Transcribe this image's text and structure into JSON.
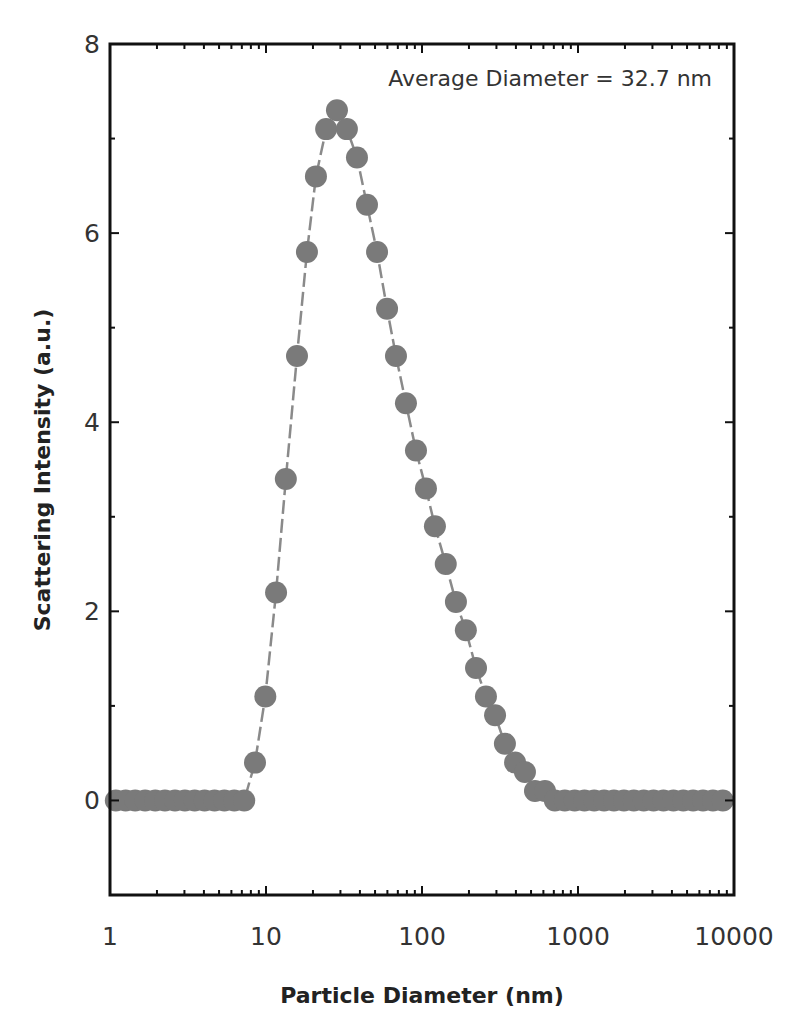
{
  "chart_data": {
    "type": "scatter",
    "title": "",
    "xlabel": "Particle Diameter (nm)",
    "ylabel": "Scattering Intensity (a.u.)",
    "xscale": "log",
    "xlim": [
      1,
      10000
    ],
    "ylim": [
      -1,
      8
    ],
    "xticks": [
      1,
      10,
      100,
      1000,
      10000
    ],
    "xtick_labels": [
      "1",
      "10",
      "100",
      "1000",
      "10000"
    ],
    "yticks": [
      0,
      2,
      4,
      6,
      8
    ],
    "ytick_labels": [
      "0",
      "2",
      "4",
      "6",
      "8"
    ],
    "grid": false,
    "annotation": "Average Diameter = 32.7 nm",
    "marker_color": "#7a7a7a",
    "line_style": "dashed",
    "series": [
      {
        "name": "DLS size distribution",
        "x": [
          1.09,
          1.26,
          1.45,
          1.68,
          1.95,
          2.25,
          2.61,
          3.02,
          3.49,
          4.04,
          4.68,
          5.41,
          6.26,
          7.25,
          8.5,
          9.9,
          11.6,
          13.4,
          15.8,
          18.3,
          20.9,
          24.3,
          28.5,
          33.0,
          38.3,
          44.4,
          51.5,
          59.7,
          68.1,
          78.9,
          91.5,
          106,
          121,
          142,
          165,
          191,
          222,
          257,
          294,
          340,
          395,
          457,
          530,
          614,
          711,
          823,
          952,
          1100,
          1270,
          1470,
          1700,
          1970,
          2280,
          2640,
          3050,
          3530,
          4090,
          4730,
          5470,
          6330,
          7330,
          8480
        ],
        "y": [
          0,
          0,
          0,
          0,
          0,
          0,
          0,
          0,
          0,
          0,
          0,
          0,
          0,
          0,
          0.4,
          1.1,
          2.2,
          3.4,
          4.7,
          5.8,
          6.6,
          7.1,
          7.3,
          7.1,
          6.8,
          6.3,
          5.8,
          5.2,
          4.7,
          4.2,
          3.7,
          3.3,
          2.9,
          2.5,
          2.1,
          1.8,
          1.4,
          1.1,
          0.9,
          0.6,
          0.4,
          0.3,
          0.1,
          0.1,
          0,
          0,
          0,
          0,
          0,
          0,
          0,
          0,
          0,
          0,
          0,
          0,
          0,
          0,
          0,
          0,
          0,
          0
        ]
      }
    ]
  }
}
